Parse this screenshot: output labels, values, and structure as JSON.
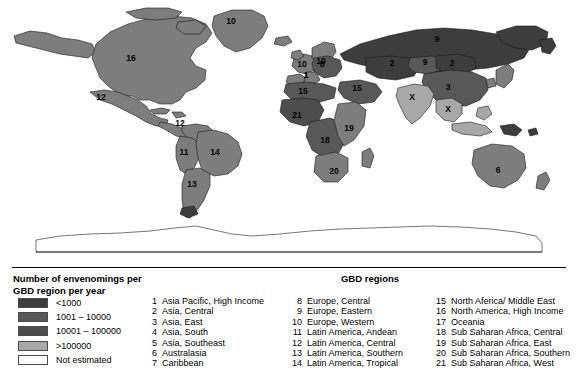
{
  "figure": {
    "type": "choropleth-world-map",
    "width": 578,
    "height": 379
  },
  "legend": {
    "scale_title_line1": "Number of envenomings per",
    "scale_title_line2": "GBD region per year",
    "gbd_heading": "GBD regions",
    "classes": [
      {
        "label": "<1000",
        "color": "#3d3d3d"
      },
      {
        "label": "1001 – 10000",
        "color": "#585858"
      },
      {
        "label": "10001 – 100000",
        "color": "#4d4d4d"
      },
      {
        "label": ">100000",
        "color": "#a8a8a8"
      },
      {
        "label": "Not estimated",
        "color": "#ffffff"
      }
    ]
  },
  "regions": {
    "column1": [
      {
        "num": "1",
        "name": "Asia Pacific, High Income"
      },
      {
        "num": "2",
        "name": "Asia, Central"
      },
      {
        "num": "3",
        "name": "Asia, East"
      },
      {
        "num": "4",
        "name": "Asia, South"
      },
      {
        "num": "5",
        "name": "Asia, Southeast"
      },
      {
        "num": "6",
        "name": "Australasia"
      },
      {
        "num": "7",
        "name": "Caribbean"
      }
    ],
    "column2": [
      {
        "num": "8",
        "name": "Europe, Central"
      },
      {
        "num": "9",
        "name": "Europe, Eastern"
      },
      {
        "num": "10",
        "name": "Europe, Western"
      },
      {
        "num": "11",
        "name": "Latin America, Andean"
      },
      {
        "num": "12",
        "name": "Latin America, Central"
      },
      {
        "num": "13",
        "name": "Latin America, Southern"
      },
      {
        "num": "14",
        "name": "Latin America, Tropical"
      }
    ],
    "column3": [
      {
        "num": "15",
        "name": "North Aferica/ Middle East"
      },
      {
        "num": "16",
        "name": "North America, High Income"
      },
      {
        "num": "17",
        "name": "Oceania"
      },
      {
        "num": "18",
        "name": "Sub Saharan Africa, Central"
      },
      {
        "num": "19",
        "name": "Sub Saharan Africa, East"
      },
      {
        "num": "20",
        "name": "Sub Saharan Africa, Southern"
      },
      {
        "num": "21",
        "name": "Sub Saharan Africa, West"
      }
    ]
  },
  "map_labels": [
    {
      "id": "greenland-10",
      "text": "10",
      "x": 231,
      "y": 22
    },
    {
      "id": "north-america-16",
      "text": "16",
      "x": 131,
      "y": 59
    },
    {
      "id": "mexico-12",
      "text": "12",
      "x": 101,
      "y": 98
    },
    {
      "id": "central-america-12",
      "text": "12",
      "x": 180,
      "y": 124
    },
    {
      "id": "andean-11",
      "text": "11",
      "x": 184,
      "y": 153
    },
    {
      "id": "brazil-14",
      "text": "14",
      "x": 215,
      "y": 153
    },
    {
      "id": "southern-cone-13",
      "text": "13",
      "x": 192,
      "y": 185
    },
    {
      "id": "scandinavia-10",
      "text": "10",
      "x": 321,
      "y": 62
    },
    {
      "id": "western-europe-10",
      "text": "10",
      "x": 302,
      "y": 65
    },
    {
      "id": "central-europe-8",
      "text": "8",
      "x": 322,
      "y": 65
    },
    {
      "id": "italy-1",
      "text": "1",
      "x": 306,
      "y": 76
    },
    {
      "id": "russia-9",
      "text": "9",
      "x": 437,
      "y": 40
    },
    {
      "id": "west-russia-2",
      "text": "2",
      "x": 392,
      "y": 64
    },
    {
      "id": "kazakh-9",
      "text": "9",
      "x": 425,
      "y": 63
    },
    {
      "id": "central-asia-2",
      "text": "2",
      "x": 452,
      "y": 64
    },
    {
      "id": "china-3",
      "text": "3",
      "x": 448,
      "y": 88
    },
    {
      "id": "south-asia-4",
      "text": "X",
      "x": 412,
      "y": 98
    },
    {
      "id": "southeast-asia-5",
      "text": "X",
      "x": 448,
      "y": 110
    },
    {
      "id": "north-africa-15",
      "text": "15",
      "x": 303,
      "y": 92
    },
    {
      "id": "middle-east-15",
      "text": "15",
      "x": 357,
      "y": 89
    },
    {
      "id": "west-africa-21",
      "text": "21",
      "x": 297,
      "y": 116
    },
    {
      "id": "central-africa-18",
      "text": "18",
      "x": 325,
      "y": 141
    },
    {
      "id": "east-africa-19",
      "text": "19",
      "x": 349,
      "y": 129
    },
    {
      "id": "southern-africa-20",
      "text": "20",
      "x": 334,
      "y": 172
    },
    {
      "id": "australia-6",
      "text": "6",
      "x": 498,
      "y": 171
    }
  ],
  "colors": {
    "class_very_dark": "#3d3d3d",
    "class_dark": "#4d4d4d",
    "class_medium": "#585858",
    "class_mid_grey": "#7d7d7d",
    "class_light": "#a8a8a8",
    "class_none": "#ffffff",
    "outline": "#1a1a1a"
  }
}
